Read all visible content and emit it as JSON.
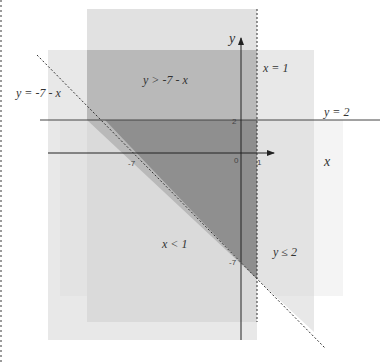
{
  "diagram": {
    "title": "",
    "axes": {
      "x_label": "x",
      "y_label": "y",
      "origin_label": "0",
      "x_ticks": [
        {
          "value": -7,
          "label": "-7"
        },
        {
          "value": 1,
          "label": "1"
        }
      ],
      "y_ticks": [
        {
          "value": 2,
          "label": "2"
        },
        {
          "value": -7,
          "label": "-7"
        }
      ]
    },
    "lines": [
      {
        "equation": "y = -7 - x",
        "style": "dashed",
        "label": "y = -7 - x"
      },
      {
        "equation": "x = 1",
        "style": "dashed",
        "label": "x = 1"
      },
      {
        "equation": "y = 2",
        "style": "solid",
        "label": "y = 2"
      }
    ],
    "regions": [
      {
        "inequality": "y > -7 - x",
        "label": "y > -7 - x"
      },
      {
        "inequality": "x < 1",
        "label": "x < 1"
      },
      {
        "inequality": "y ≤ 2",
        "label": "y ≤ 2"
      }
    ],
    "solution_region": "triangle bounded by y = -7 - x, x = 1, y = 2",
    "colors": {
      "region_light": "#e3e3e3",
      "region_mid": "#c8c8c8",
      "region_dark": "#999999",
      "faint": "#f4f4f4",
      "line": "#333333"
    }
  }
}
